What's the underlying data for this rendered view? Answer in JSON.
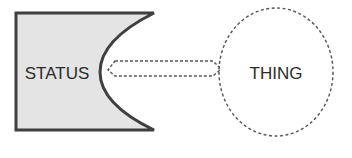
{
  "diagram": {
    "status_shape": {
      "label": "STATUS",
      "fill": "#e6e6e6",
      "stroke": "#444444"
    },
    "thing_shape": {
      "label": "THING",
      "stroke": "#555555"
    },
    "connector": {
      "type": "dashed-double-arrow",
      "stroke": "#555555"
    }
  }
}
